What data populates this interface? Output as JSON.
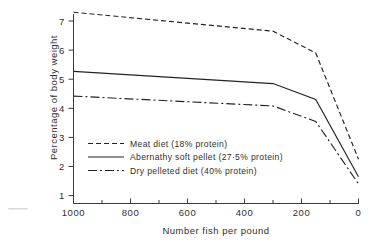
{
  "chart_data": {
    "type": "line",
    "title": "",
    "xlabel": "Number fish per pound",
    "ylabel": "Percentage of body weight",
    "xlim": [
      1000,
      0
    ],
    "ylim": [
      0.6,
      7.6
    ],
    "x_ticks": [
      1000,
      800,
      600,
      400,
      200,
      0
    ],
    "x_tick_labels": [
      "1000",
      "800",
      "600",
      "400",
      "200",
      "0"
    ],
    "x_minor_ticks": [
      900,
      700,
      500,
      300,
      100
    ],
    "y_ticks": [
      1,
      2,
      3,
      4,
      5,
      6,
      7
    ],
    "y_tick_labels": [
      "1",
      "2",
      "3",
      "4",
      "5",
      "6",
      "7"
    ],
    "grid": false,
    "x_axis_reversed": true,
    "legend_position": "center-left",
    "series": [
      {
        "name": "Meat diet (18% protein)",
        "dash": "dashed",
        "dash_pattern": "5,3",
        "points": [
          {
            "x": 1000,
            "y": 7.3
          },
          {
            "x": 300,
            "y": 6.65
          },
          {
            "x": 150,
            "y": 5.9
          },
          {
            "x": 0,
            "y": 2.25
          }
        ]
      },
      {
        "name": "Abernathy soft pellet (27·5% protein)",
        "dash": "solid",
        "dash_pattern": "none",
        "points": [
          {
            "x": 1000,
            "y": 5.27
          },
          {
            "x": 300,
            "y": 4.85
          },
          {
            "x": 150,
            "y": 4.3
          },
          {
            "x": 0,
            "y": 1.65
          }
        ]
      },
      {
        "name": "Dry pelleted diet (40% protein)",
        "dash": "dash-dot",
        "dash_pattern": "9,3,2,3",
        "points": [
          {
            "x": 1000,
            "y": 4.42
          },
          {
            "x": 300,
            "y": 4.08
          },
          {
            "x": 150,
            "y": 3.55
          },
          {
            "x": 0,
            "y": 1.4
          }
        ]
      }
    ]
  },
  "axes": {
    "y_title": "Percentage of body weight",
    "x_title": "Number fish per pound",
    "y_tick_labels": [
      "7",
      "6",
      "5",
      "4",
      "3",
      "2",
      "1"
    ],
    "x_tick_labels": [
      "1000",
      "800",
      "600",
      "400",
      "200",
      "0"
    ]
  },
  "legend": {
    "entries": [
      {
        "label": "Meat diet (18% protein)"
      },
      {
        "label": "Abernathy soft pellet (27·5% protein)"
      },
      {
        "label": "Dry pelleted diet (40% protein)"
      }
    ]
  },
  "colors": {
    "ink": "#232323",
    "axis": "#3a3a3a",
    "background": "#ffffff"
  }
}
